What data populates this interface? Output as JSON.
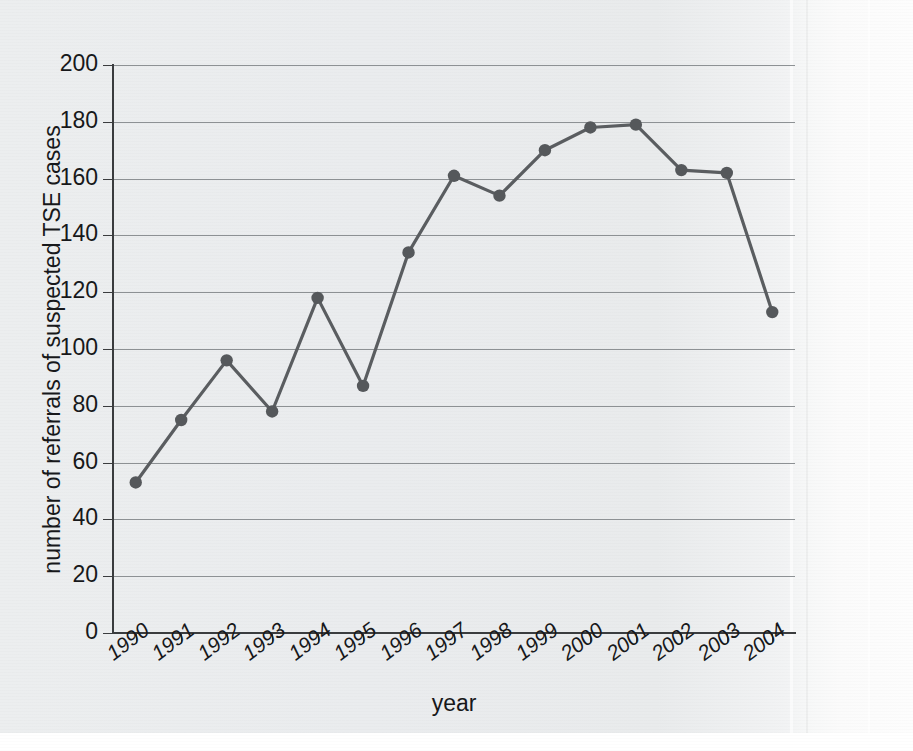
{
  "chart_data": {
    "type": "line",
    "title": "",
    "xlabel": "year",
    "ylabel": "number of referrals of suspected TSE cases",
    "categories": [
      "1990",
      "1991",
      "1992",
      "1993",
      "1994",
      "1995",
      "1996",
      "1997",
      "1998",
      "1999",
      "2000",
      "2001",
      "2002",
      "2003",
      "2004"
    ],
    "values": [
      53,
      75,
      96,
      78,
      118,
      87,
      134,
      161,
      154,
      170,
      178,
      179,
      163,
      162,
      113
    ],
    "series": [
      {
        "name": "number of referrals of suspected TSE cases",
        "values": [
          53,
          75,
          96,
          78,
          118,
          87,
          134,
          161,
          154,
          170,
          178,
          179,
          163,
          162,
          113
        ]
      }
    ],
    "ylim": [
      0,
      200
    ],
    "ytick_labels": [
      "0",
      "20",
      "40",
      "60",
      "80",
      "100",
      "120",
      "140",
      "160",
      "180",
      "200"
    ],
    "ytick_values": [
      0,
      20,
      40,
      60,
      80,
      100,
      120,
      140,
      160,
      180,
      200
    ],
    "xtick_labels": [
      "1990",
      "1991",
      "1992",
      "1993",
      "1994",
      "1995",
      "1996",
      "1997",
      "1998",
      "1999",
      "2000",
      "2001",
      "2002",
      "2003",
      "2004"
    ],
    "grid": "horizontal",
    "legend": "none",
    "marker": "circle",
    "line_color": "#5a5d60",
    "marker_color": "#55585b",
    "grid_color": "#8d9194",
    "axis_color": "#3a3c3e",
    "background_color": "#eceeef"
  }
}
